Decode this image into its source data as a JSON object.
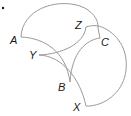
{
  "diagram": {
    "type": "geometry-figure",
    "stroke_color": "#9a9a9a",
    "label_color": "#1a1a1a",
    "bullet": "•",
    "shapes": [
      {
        "name": "triangle-ABC",
        "vertices": [
          "A",
          "B",
          "C"
        ]
      },
      {
        "name": "triangle-XYZ",
        "vertices": [
          "X",
          "Y",
          "Z"
        ]
      }
    ],
    "labels": {
      "A": "A",
      "B": "B",
      "C": "C",
      "X": "X",
      "Y": "Y",
      "Z": "Z"
    }
  }
}
